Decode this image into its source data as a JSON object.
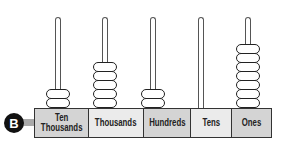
{
  "marker": {
    "label": "B"
  },
  "abacus": {
    "value": "25,207",
    "columns": [
      {
        "label": "Ten\nThousands",
        "beads": 2,
        "fill": "#d4d4d4"
      },
      {
        "label": "Thousands",
        "beads": 5,
        "fill": "#ebebeb"
      },
      {
        "label": "Hundreds",
        "beads": 2,
        "fill": "#d4d4d4"
      },
      {
        "label": "Tens",
        "beads": 0,
        "fill": "#ebebeb"
      },
      {
        "label": "Ones",
        "beads": 7,
        "fill": "#d4d4d4"
      }
    ]
  },
  "colors": {
    "bead_outline": "#222222",
    "rod_outline": "#555555",
    "connector": "#aaaaaa",
    "marker_bg": "#111111"
  }
}
